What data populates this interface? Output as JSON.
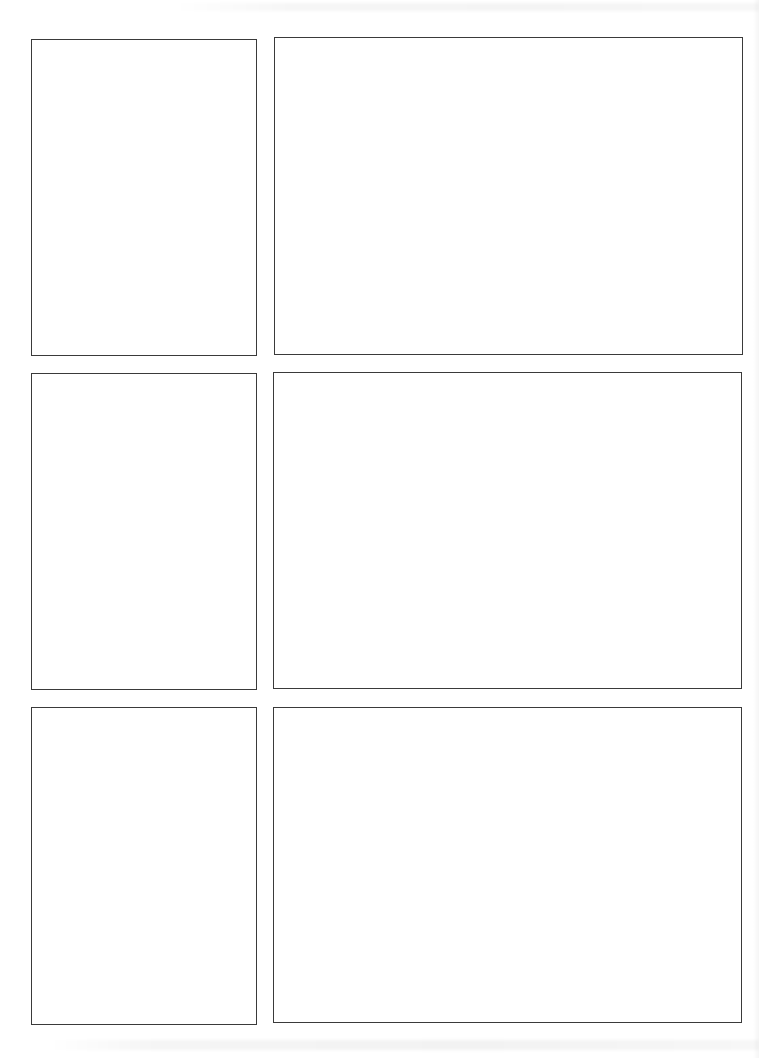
{
  "page": {
    "type": "blank comic storyboard page",
    "background_color": "#ffffff",
    "border_color": "#3a3a3a",
    "rows": 3,
    "columns": 2
  },
  "panels": [
    {
      "row": 1,
      "column": 1,
      "content": ""
    },
    {
      "row": 1,
      "column": 2,
      "content": ""
    },
    {
      "row": 2,
      "column": 1,
      "content": ""
    },
    {
      "row": 2,
      "column": 2,
      "content": ""
    },
    {
      "row": 3,
      "column": 1,
      "content": ""
    },
    {
      "row": 3,
      "column": 2,
      "content": ""
    }
  ]
}
